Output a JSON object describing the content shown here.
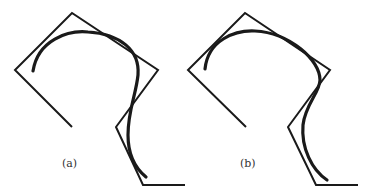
{
  "figure": {
    "panels": [
      {
        "label": "(a)",
        "label_pos": [
          62,
          167
        ],
        "control_polygon": [
          [
            72,
            127
          ],
          [
            15,
            70
          ],
          [
            72,
            13
          ],
          [
            158,
            70
          ],
          [
            116,
            127
          ],
          [
            143,
            185
          ],
          [
            185,
            185
          ]
        ],
        "curve_path": "M33,71 C38,40 68,30 88,32 C120,34 140,50 138,75 C136,95 128,110 128,135 C128,155 135,168 146,177"
      },
      {
        "label": "(b)",
        "label_pos": [
          240,
          167
        ],
        "control_polygon": [
          [
            246,
            127
          ],
          [
            188,
            70
          ],
          [
            245,
            13
          ],
          [
            330,
            70
          ],
          [
            288,
            127
          ],
          [
            316,
            185
          ],
          [
            358,
            185
          ]
        ],
        "curve_path": "M205,69 C208,40 235,30 255,31 C290,33 320,60 320,80 C320,92 305,105 303,125 C301,148 312,170 327,180"
      }
    ],
    "stroke_color": "#1a1a1a"
  }
}
